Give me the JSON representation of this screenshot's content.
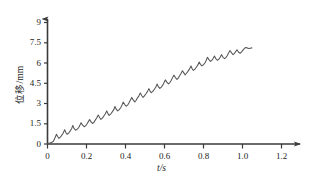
{
  "chart_data": {
    "type": "line",
    "title": "",
    "xlabel": "t/s",
    "ylabel": "位移/mm",
    "xlim": [
      0,
      1.25
    ],
    "ylim": [
      0,
      9.4
    ],
    "grid": false,
    "legend": null,
    "xticks": [
      "0",
      "0.2",
      "0.4",
      "0.6",
      "0.8",
      "1.0",
      "1.2"
    ],
    "xtick_values": [
      0,
      0.2,
      0.4,
      0.6,
      0.8,
      1.0,
      1.2
    ],
    "yticks": [
      "0",
      "1.5",
      "3",
      "4.5",
      "6",
      "7.5",
      "9"
    ],
    "ytick_values": [
      0,
      1.5,
      3,
      4.5,
      6,
      7.5,
      9
    ],
    "series": [
      {
        "name": "displacement",
        "color": "#555555",
        "description": "stick-slip displacement rising with sawtooth oscillation",
        "x": [
          0.0,
          0.012,
          0.022,
          0.03,
          0.038,
          0.046,
          0.052,
          0.058,
          0.064,
          0.072,
          0.08,
          0.088,
          0.094,
          0.1,
          0.108,
          0.116,
          0.124,
          0.13,
          0.136,
          0.144,
          0.152,
          0.16,
          0.166,
          0.172,
          0.18,
          0.188,
          0.196,
          0.202,
          0.208,
          0.216,
          0.224,
          0.232,
          0.238,
          0.244,
          0.252,
          0.26,
          0.268,
          0.274,
          0.28,
          0.288,
          0.296,
          0.304,
          0.31,
          0.316,
          0.324,
          0.332,
          0.34,
          0.346,
          0.352,
          0.36,
          0.368,
          0.376,
          0.382,
          0.388,
          0.396,
          0.404,
          0.412,
          0.418,
          0.424,
          0.432,
          0.44,
          0.448,
          0.454,
          0.46,
          0.468,
          0.476,
          0.484,
          0.49,
          0.496,
          0.504,
          0.512,
          0.52,
          0.526,
          0.532,
          0.54,
          0.548,
          0.556,
          0.562,
          0.568,
          0.576,
          0.584,
          0.592,
          0.598,
          0.604,
          0.612,
          0.62,
          0.628,
          0.634,
          0.64,
          0.648,
          0.656,
          0.664,
          0.67,
          0.676,
          0.684,
          0.692,
          0.7,
          0.706,
          0.712,
          0.72,
          0.728,
          0.736,
          0.742,
          0.748,
          0.756,
          0.764,
          0.772,
          0.778,
          0.784,
          0.792,
          0.8,
          0.808,
          0.814,
          0.82,
          0.828,
          0.836,
          0.844,
          0.85,
          0.856,
          0.864,
          0.872,
          0.88,
          0.886,
          0.892,
          0.9,
          0.908,
          0.916,
          0.922,
          0.928,
          0.936,
          0.944,
          0.952,
          0.958,
          0.964,
          0.972,
          0.98,
          0.988,
          0.994,
          1.0,
          1.008,
          1.016,
          1.024,
          1.032,
          1.04,
          1.048
        ],
        "y": [
          0.05,
          0.08,
          0.12,
          0.2,
          0.45,
          0.72,
          0.55,
          0.42,
          0.48,
          0.62,
          0.8,
          1.05,
          0.85,
          0.72,
          0.8,
          0.95,
          1.15,
          1.38,
          1.15,
          1.02,
          1.1,
          1.22,
          1.38,
          1.58,
          1.4,
          1.28,
          1.35,
          1.48,
          1.62,
          1.82,
          1.62,
          1.52,
          1.6,
          1.75,
          1.92,
          2.15,
          1.95,
          1.82,
          1.9,
          2.05,
          2.22,
          2.45,
          2.25,
          2.12,
          2.22,
          2.38,
          2.55,
          2.78,
          2.58,
          2.45,
          2.55,
          2.7,
          2.88,
          3.1,
          2.92,
          2.8,
          2.9,
          3.05,
          3.22,
          3.45,
          3.25,
          3.12,
          3.22,
          3.38,
          3.55,
          3.78,
          3.58,
          3.45,
          3.55,
          3.7,
          3.88,
          4.1,
          3.92,
          3.8,
          3.9,
          4.05,
          4.22,
          4.45,
          4.25,
          4.12,
          4.22,
          4.38,
          4.55,
          4.75,
          4.58,
          4.45,
          4.55,
          4.7,
          4.88,
          5.1,
          4.92,
          4.78,
          4.88,
          5.02,
          5.2,
          5.42,
          5.25,
          5.12,
          5.22,
          5.38,
          5.55,
          5.78,
          5.58,
          5.45,
          5.55,
          5.7,
          5.88,
          6.08,
          5.9,
          5.78,
          5.88,
          6.02,
          6.2,
          6.42,
          6.25,
          6.12,
          6.22,
          6.35,
          6.52,
          6.3,
          6.2,
          6.3,
          6.45,
          6.62,
          6.42,
          6.32,
          6.42,
          6.55,
          6.72,
          6.92,
          6.75,
          6.62,
          6.7,
          6.82,
          6.98,
          6.8,
          6.72,
          6.8,
          6.92,
          7.05,
          7.15,
          7.12,
          7.08,
          7.1,
          7.12
        ]
      }
    ]
  },
  "axes": {
    "y_label_text": "位移/mm",
    "x_label_text": "t/s"
  }
}
